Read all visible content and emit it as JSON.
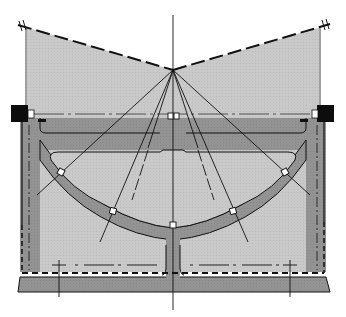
{
  "diagram": {
    "type": "engineering cross-section",
    "colors": {
      "background": "#ffffff",
      "light_fill": "#c9c9c9",
      "structure_fill": "#929292",
      "line": "#111111",
      "block": "#0d0d0d",
      "void_white": "#ffffff"
    },
    "apex": {
      "x": 173,
      "y": 70
    },
    "labels": [],
    "components": [
      "top-dashed-boundary-left",
      "top-dashed-boundary-right",
      "center-axis",
      "radial-lines",
      "deck-slab",
      "arch-ring",
      "bearing-blocks",
      "joint-markers",
      "base-slab",
      "dashed-bottom-line"
    ],
    "joint_marker_count": 7,
    "radial_line_count": 6
  }
}
